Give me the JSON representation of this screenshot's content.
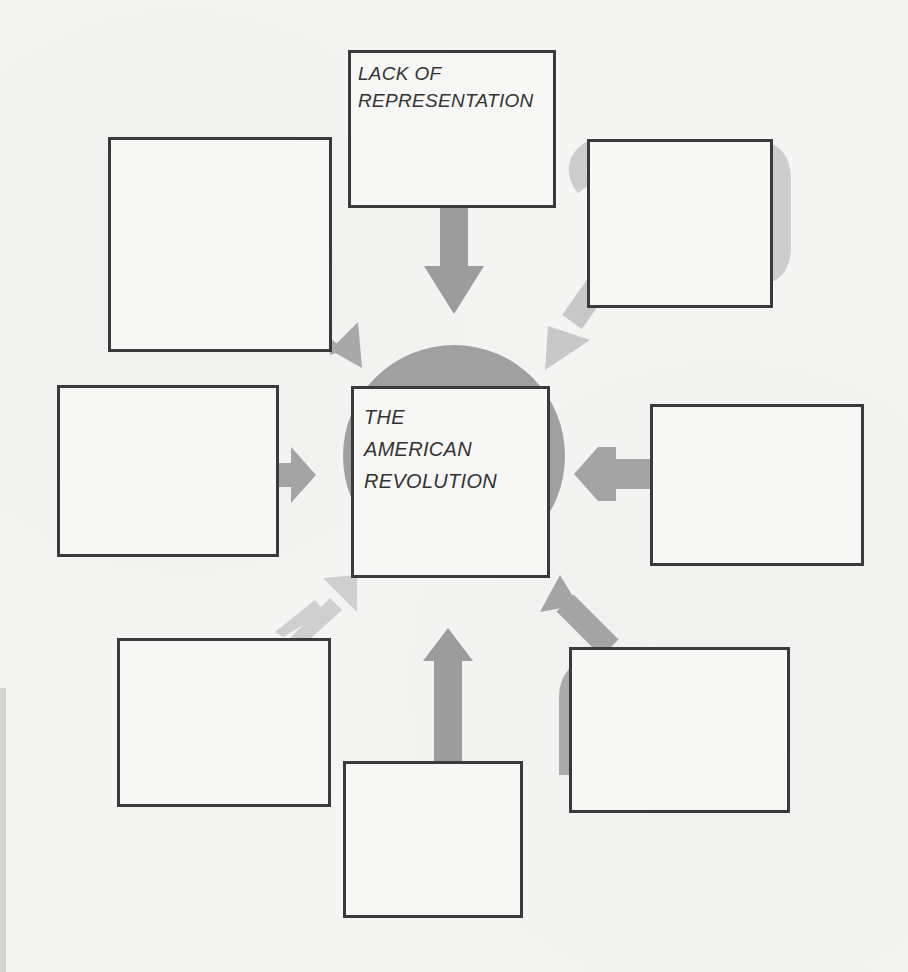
{
  "diagram": {
    "center": {
      "label": "THE\nAMERICAN\nREVOLUTION"
    },
    "boxes": [
      {
        "id": "top",
        "label": "LACK OF\nREPRESENTATION"
      },
      {
        "id": "top-left",
        "label": ""
      },
      {
        "id": "top-right",
        "label": ""
      },
      {
        "id": "left",
        "label": ""
      },
      {
        "id": "right",
        "label": ""
      },
      {
        "id": "bottom-left",
        "label": ""
      },
      {
        "id": "bottom",
        "label": ""
      },
      {
        "id": "bottom-right",
        "label": ""
      }
    ],
    "colors": {
      "arrow_dark": "#9c9c9c",
      "arrow_light": "#c8c8c8",
      "circle": "#a0a0a0",
      "box_border": "#3a3a3a",
      "text": "#333333",
      "background": "#f5f5f3"
    }
  }
}
